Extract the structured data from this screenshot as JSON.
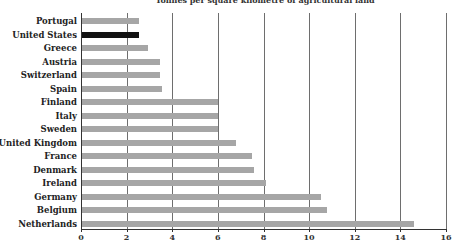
{
  "chart_data": {
    "type": "bar",
    "orientation": "horizontal",
    "title": "Tonnes per square kilometre of agricultural land",
    "xlabel": "",
    "ylabel": "",
    "xlim": [
      0,
      16
    ],
    "xticks": [
      0,
      2,
      4,
      6,
      8,
      10,
      12,
      14,
      16
    ],
    "grid": "vertical",
    "highlight": "United States",
    "colors": {
      "bar": "#a6a6a6",
      "highlight": "#111111"
    },
    "categories": [
      "Portugal",
      "United States",
      "Greece",
      "Austria",
      "Switzerland",
      "Spain",
      "Finland",
      "Italy",
      "Sweden",
      "United Kingdom",
      "France",
      "Denmark",
      "Ireland",
      "Germany",
      "Belgium",
      "Netherlands"
    ],
    "values": [
      2.55,
      2.55,
      2.95,
      3.45,
      3.45,
      3.55,
      6.0,
      6.0,
      6.0,
      6.8,
      7.5,
      7.6,
      8.1,
      10.5,
      10.8,
      14.6
    ]
  }
}
